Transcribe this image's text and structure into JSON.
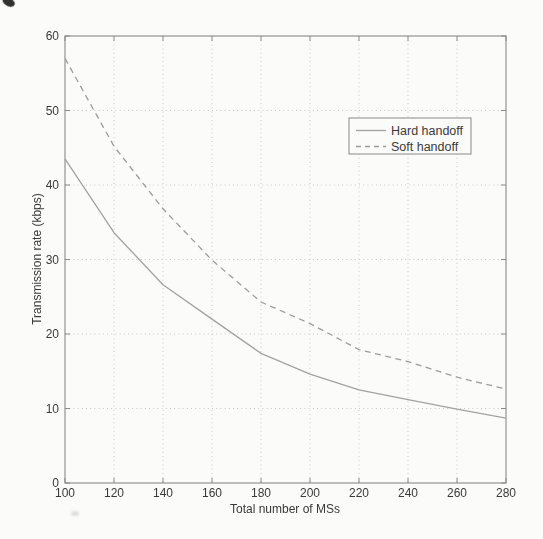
{
  "chart_data": {
    "type": "line",
    "xlabel": "Total number of MSs",
    "ylabel": "Transmission rate (kbps)",
    "xlim": [
      100,
      280
    ],
    "ylim": [
      0,
      60
    ],
    "xticks": [
      100,
      120,
      140,
      160,
      180,
      200,
      220,
      240,
      260,
      280
    ],
    "yticks": [
      0,
      10,
      20,
      30,
      40,
      50,
      60
    ],
    "grid": true,
    "grid_style": "dotted",
    "legend_position": "upper-right-inside",
    "x": [
      100,
      120,
      140,
      160,
      180,
      200,
      220,
      240,
      260,
      280
    ],
    "series": [
      {
        "name": "Hard handoff",
        "line_style": "solid",
        "color": "#a2a2a2",
        "values": [
          43.5,
          33.6,
          26.6,
          22.0,
          17.4,
          14.6,
          12.5,
          11.2,
          9.9,
          8.7
        ]
      },
      {
        "name": "Soft handoff",
        "line_style": "dashed",
        "color": "#9c9c9c",
        "values": [
          57.0,
          45.2,
          36.8,
          29.9,
          24.3,
          21.4,
          17.9,
          16.3,
          14.2,
          12.6
        ]
      }
    ]
  },
  "legend": {
    "items": [
      {
        "label": "Hard handoff",
        "sample": "solid-line"
      },
      {
        "label": "Soft handoff",
        "sample": "dashed-line"
      }
    ]
  },
  "colors": {
    "paper": "#fbfbf9",
    "axis": "#8a8a8a",
    "grid": "#c3c3c3",
    "text": "#3a3a3a",
    "legend_border": "#8a8a8a",
    "hard_handoff_line": "#a2a2a2",
    "soft_handoff_line": "#9c9c9c"
  }
}
